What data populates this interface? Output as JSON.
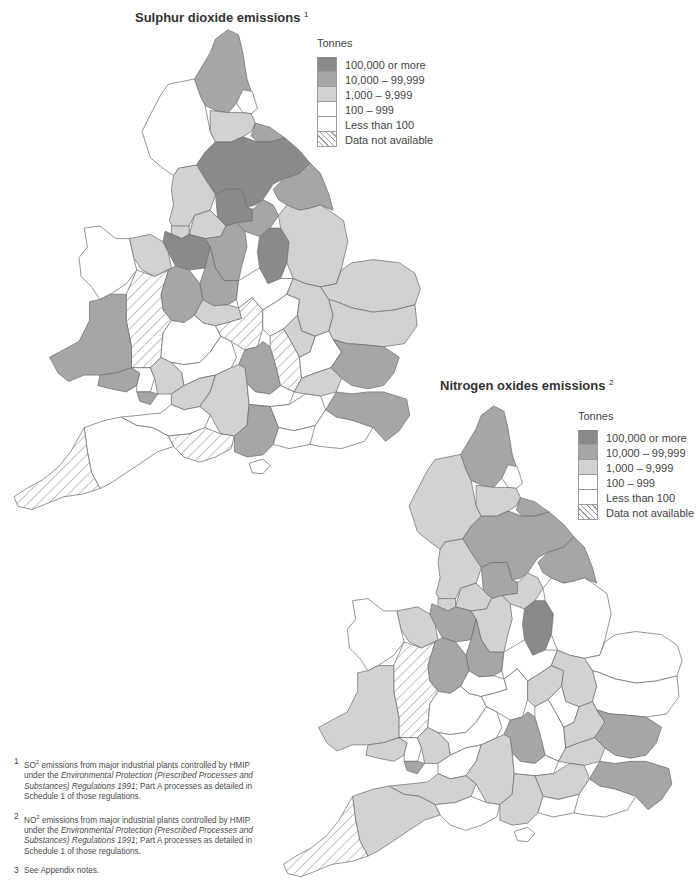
{
  "colors": {
    "c100k": "#8a8a8a",
    "c10k": "#a6a6a6",
    "c1k": "#d2d2d2",
    "c100": "#ffffff",
    "clt100": "#ffffff",
    "na": "url(#hatch)",
    "border": "#6e6e6e"
  },
  "legend_items": [
    {
      "key": "c100k",
      "label": "100,000 or more"
    },
    {
      "key": "c10k",
      "label": "10,000 – 99,999"
    },
    {
      "key": "c1k",
      "label": "1,000 – 9,999"
    },
    {
      "key": "c100",
      "label": "100 – 999"
    },
    {
      "key": "clt100",
      "label": "Less than 100"
    },
    {
      "key": "na",
      "label": "Data not available"
    }
  ],
  "map_so2": {
    "title": "Sulphur dioxide emissions",
    "footnote_ref": "1",
    "legend_title": "Tonnes",
    "legend": [
      "100,000 or more",
      "10,000 – 99,999",
      "1,000 – 9,999",
      "100 – 999",
      "Less than 100",
      "Data not available"
    ]
  },
  "map_nox": {
    "title": "Nitrogen oxides emissions",
    "footnote_ref": "2",
    "legend_title": "Tonnes",
    "legend": [
      "100,000 or more",
      "10,000 – 99,999",
      "1,000 – 9,999",
      "100 – 999",
      "Less than 100",
      "Data not available"
    ]
  },
  "notes": [
    {
      "num": "1",
      "pre": "SO",
      "sup": "2",
      "text1": " emissions from major industrial plants controlled by HMIP under the ",
      "italic": "Environmental Protection (Prescribed Processes and Substances) Regulations 1991",
      "text2": "; Part A  processes as detailed in Schedule 1 of those regulations."
    },
    {
      "num": "2",
      "pre": "NO",
      "sup": "2",
      "text1": " emissions from major industrial plants controlled by HMIP under the ",
      "italic": "Environmental Protection (Prescribed Processes and Substances) Regulations 1991",
      "text2": "; Part A  processes as detailed in Schedule 1 of those regulations."
    },
    {
      "num": "3",
      "pre": "",
      "sup": "",
      "text1": "See Appendix notes.",
      "italic": "",
      "text2": ""
    }
  ],
  "regions_so2": [
    {
      "name": "Northumberland",
      "cls": "c10k"
    },
    {
      "name": "Tyne and Wear",
      "cls": "c100"
    },
    {
      "name": "Cumbria",
      "cls": "c100"
    },
    {
      "name": "Durham",
      "cls": "c1k"
    },
    {
      "name": "Cleveland",
      "cls": "c10k"
    },
    {
      "name": "North Yorkshire",
      "cls": "c100k"
    },
    {
      "name": "Humberside",
      "cls": "c10k"
    },
    {
      "name": "Lancashire",
      "cls": "c1k"
    },
    {
      "name": "West Yorkshire",
      "cls": "c100k"
    },
    {
      "name": "Greater Manchester",
      "cls": "c1k"
    },
    {
      "name": "South Yorkshire",
      "cls": "c10k"
    },
    {
      "name": "Merseyside",
      "cls": "c1k"
    },
    {
      "name": "Cheshire",
      "cls": "c100k"
    },
    {
      "name": "Derbyshire",
      "cls": "c10k"
    },
    {
      "name": "Nottinghamshire",
      "cls": "c100k"
    },
    {
      "name": "Lincolnshire",
      "cls": "c1k"
    },
    {
      "name": "Clwyd",
      "cls": "c1k"
    },
    {
      "name": "Gwynedd",
      "cls": "c100"
    },
    {
      "name": "Staffordshire",
      "cls": "c10k"
    },
    {
      "name": "Shropshire",
      "cls": "c10k"
    },
    {
      "name": "Powys",
      "cls": "na"
    },
    {
      "name": "Dyfed",
      "cls": "c10k"
    },
    {
      "name": "West Glamorgan",
      "cls": "c10k"
    },
    {
      "name": "Mid Glamorgan",
      "cls": "c100"
    },
    {
      "name": "South Glamorgan",
      "cls": "c10k"
    },
    {
      "name": "Gwent",
      "cls": "c1k"
    },
    {
      "name": "Hereford and Worcester",
      "cls": "c100"
    },
    {
      "name": "West Midlands",
      "cls": "c1k"
    },
    {
      "name": "Warwickshire",
      "cls": "na"
    },
    {
      "name": "Leicestershire",
      "cls": "c100"
    },
    {
      "name": "Northamptonshire",
      "cls": "c100"
    },
    {
      "name": "Cambridgeshire",
      "cls": "c1k"
    },
    {
      "name": "Norfolk",
      "cls": "c1k"
    },
    {
      "name": "Suffolk",
      "cls": "c1k"
    },
    {
      "name": "Gloucestershire",
      "cls": "c100"
    },
    {
      "name": "Oxfordshire",
      "cls": "c10k"
    },
    {
      "name": "Buckinghamshire",
      "cls": "na"
    },
    {
      "name": "Bedfordshire",
      "cls": "c1k"
    },
    {
      "name": "Hertfordshire",
      "cls": "c100"
    },
    {
      "name": "Essex",
      "cls": "c10k"
    },
    {
      "name": "Greater London",
      "cls": "c1k"
    },
    {
      "name": "Avon",
      "cls": "c1k"
    },
    {
      "name": "Wiltshire",
      "cls": "c1k"
    },
    {
      "name": "Berkshire",
      "cls": "c100"
    },
    {
      "name": "Surrey",
      "cls": "c100"
    },
    {
      "name": "Kent",
      "cls": "c10k"
    },
    {
      "name": "Somerset",
      "cls": "c100"
    },
    {
      "name": "Dorset",
      "cls": "na"
    },
    {
      "name": "Hampshire",
      "cls": "c10k"
    },
    {
      "name": "West Sussex",
      "cls": "c100"
    },
    {
      "name": "East Sussex",
      "cls": "c100"
    },
    {
      "name": "Isle of Wight",
      "cls": "c100"
    },
    {
      "name": "Devon",
      "cls": "c100"
    },
    {
      "name": "Cornwall",
      "cls": "na"
    }
  ],
  "regions_nox": [
    {
      "name": "Northumberland",
      "cls": "c10k"
    },
    {
      "name": "Tyne and Wear",
      "cls": "c100"
    },
    {
      "name": "Cumbria",
      "cls": "c1k"
    },
    {
      "name": "Durham",
      "cls": "c1k"
    },
    {
      "name": "Cleveland",
      "cls": "c10k"
    },
    {
      "name": "North Yorkshire",
      "cls": "c10k"
    },
    {
      "name": "Humberside",
      "cls": "c10k"
    },
    {
      "name": "Lancashire",
      "cls": "c1k"
    },
    {
      "name": "West Yorkshire",
      "cls": "c10k"
    },
    {
      "name": "Greater Manchester",
      "cls": "c1k"
    },
    {
      "name": "South Yorkshire",
      "cls": "c1k"
    },
    {
      "name": "Merseyside",
      "cls": "c1k"
    },
    {
      "name": "Cheshire",
      "cls": "c10k"
    },
    {
      "name": "Derbyshire",
      "cls": "c1k"
    },
    {
      "name": "Nottinghamshire",
      "cls": "c100k"
    },
    {
      "name": "Lincolnshire",
      "cls": "c100"
    },
    {
      "name": "Clwyd",
      "cls": "c1k"
    },
    {
      "name": "Gwynedd",
      "cls": "c100"
    },
    {
      "name": "Staffordshire",
      "cls": "c10k"
    },
    {
      "name": "Shropshire",
      "cls": "c10k"
    },
    {
      "name": "Powys",
      "cls": "na"
    },
    {
      "name": "Dyfed",
      "cls": "c1k"
    },
    {
      "name": "West Glamorgan",
      "cls": "c1k"
    },
    {
      "name": "Mid Glamorgan",
      "cls": "c100"
    },
    {
      "name": "South Glamorgan",
      "cls": "c10k"
    },
    {
      "name": "Gwent",
      "cls": "c1k"
    },
    {
      "name": "Hereford and Worcester",
      "cls": "c100"
    },
    {
      "name": "West Midlands",
      "cls": "c100"
    },
    {
      "name": "Warwickshire",
      "cls": "c100"
    },
    {
      "name": "Leicestershire",
      "cls": "c100"
    },
    {
      "name": "Northamptonshire",
      "cls": "c1k"
    },
    {
      "name": "Cambridgeshire",
      "cls": "c1k"
    },
    {
      "name": "Norfolk",
      "cls": "c100"
    },
    {
      "name": "Suffolk",
      "cls": "c100"
    },
    {
      "name": "Gloucestershire",
      "cls": "c100"
    },
    {
      "name": "Oxfordshire",
      "cls": "c10k"
    },
    {
      "name": "Buckinghamshire",
      "cls": "c100"
    },
    {
      "name": "Bedfordshire",
      "cls": "c100"
    },
    {
      "name": "Hertfordshire",
      "cls": "c1k"
    },
    {
      "name": "Essex",
      "cls": "c10k"
    },
    {
      "name": "Greater London",
      "cls": "c1k"
    },
    {
      "name": "Avon",
      "cls": "c100"
    },
    {
      "name": "Wiltshire",
      "cls": "c1k"
    },
    {
      "name": "Berkshire",
      "cls": "c100"
    },
    {
      "name": "Surrey",
      "cls": "c1k"
    },
    {
      "name": "Kent",
      "cls": "c10k"
    },
    {
      "name": "Somerset",
      "cls": "c1k"
    },
    {
      "name": "Dorset",
      "cls": "c100"
    },
    {
      "name": "Hampshire",
      "cls": "c1k"
    },
    {
      "name": "West Sussex",
      "cls": "c100"
    },
    {
      "name": "East Sussex",
      "cls": "c100"
    },
    {
      "name": "Isle of Wight",
      "cls": "c100"
    },
    {
      "name": "Devon",
      "cls": "c1k"
    },
    {
      "name": "Cornwall",
      "cls": "na"
    }
  ]
}
